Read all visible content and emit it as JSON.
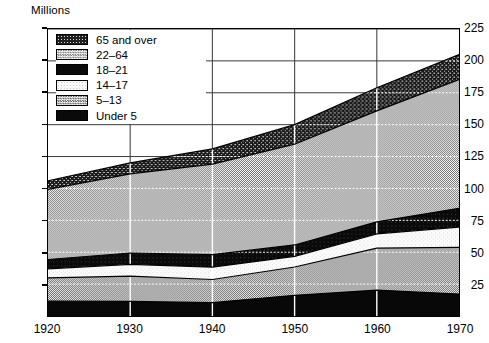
{
  "axis_title": "Millions",
  "legend": {
    "items": [
      {
        "label": "65 and over",
        "swatch": "dark-speckle-pattern"
      },
      {
        "label": "22–64",
        "swatch": "light-checker-pattern"
      },
      {
        "label": "18–21",
        "swatch": "solid-black"
      },
      {
        "label": "14–17",
        "swatch": "near-white-pattern"
      },
      {
        "label": "5–13",
        "swatch": "medium-checker-pattern"
      },
      {
        "label": "Under 5",
        "swatch": "solid-black"
      }
    ]
  },
  "chart_data": {
    "type": "area",
    "title": "",
    "subtitle": "",
    "xlabel": "",
    "ylabel": "Millions",
    "stacked": true,
    "grid": true,
    "legend_position": "top-left-inside",
    "x": [
      1920,
      1930,
      1940,
      1950,
      1960,
      1970
    ],
    "xlim": [
      1920,
      1970
    ],
    "ylim": [
      0,
      225
    ],
    "xticks": [
      1920,
      1930,
      1940,
      1950,
      1960,
      1970
    ],
    "xticklabels": [
      "1920",
      "1930",
      "1940",
      "1950",
      "1960",
      "1970"
    ],
    "yticks": [
      25,
      50,
      75,
      100,
      125,
      150,
      175,
      200,
      225
    ],
    "yticklabels": [
      "25",
      "50",
      "75",
      "100",
      "125",
      "150",
      "175",
      "200",
      "225"
    ],
    "series": [
      {
        "name": "Under 5",
        "values": [
          11.6,
          11.4,
          10.5,
          16.2,
          20.3,
          17.2
        ]
      },
      {
        "name": "5–13",
        "values": [
          18.3,
          19.8,
          18.1,
          22.2,
          32.9,
          36.6
        ]
      },
      {
        "name": "14–17",
        "values": [
          7.1,
          9.3,
          9.7,
          8.4,
          11.2,
          15.9
        ]
      },
      {
        "name": "18–21",
        "values": [
          7.3,
          8.9,
          9.8,
          8.9,
          9.4,
          14.7
        ]
      },
      {
        "name": "22–64",
        "values": [
          55.0,
          62.0,
          71.0,
          79.0,
          87.0,
          101.0
        ]
      },
      {
        "name": "65 and over",
        "values": [
          6.7,
          8.6,
          11.9,
          15.3,
          18.2,
          19.6
        ]
      }
    ],
    "cumulative_tops": {
      "Under 5": [
        11.6,
        11.4,
        10.5,
        16.2,
        20.3,
        17.2
      ],
      "5–13": [
        29.9,
        31.2,
        28.6,
        38.4,
        53.2,
        53.8
      ],
      "14–17": [
        37.0,
        40.5,
        38.3,
        46.8,
        64.4,
        69.7
      ],
      "18–21": [
        44.3,
        49.4,
        48.1,
        55.7,
        73.8,
        84.4
      ],
      "22–64": [
        99.3,
        111.4,
        119.1,
        134.7,
        160.8,
        185.4
      ],
      "65 and over": [
        106.0,
        120.0,
        131.0,
        150.0,
        179.0,
        205.0
      ]
    }
  }
}
